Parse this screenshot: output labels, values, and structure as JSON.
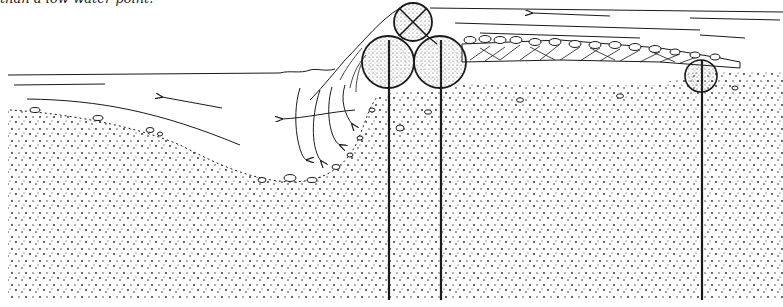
{
  "caption": "than a low-water point.",
  "diagram": {
    "type": "cross-section",
    "colors": {
      "ink": "#1a1a1a",
      "background": "#ffffff"
    },
    "elements": {
      "streambed": "stippled sand/gravel substrate",
      "scour_hole": "depression downstream of logs with pebble lining",
      "logs": [
        {
          "name": "top-log",
          "marked": "X (crossed)",
          "cx": 413,
          "cy": 22,
          "r": 19
        },
        {
          "name": "left-base-log",
          "cx": 388,
          "cy": 62,
          "r": 26
        },
        {
          "name": "right-base-log",
          "cx": 440,
          "cy": 62,
          "r": 26
        },
        {
          "name": "right-small-log",
          "cx": 701,
          "cy": 76,
          "r": 16
        }
      ],
      "stakes": [
        {
          "name": "stake-1",
          "x": 389
        },
        {
          "name": "stake-2",
          "x": 441
        },
        {
          "name": "stake-3",
          "x": 702
        }
      ],
      "flow_arrows": [
        "upper-right flow arrow pointing left",
        "lower-left flow arrow pointing left",
        "eddy arrows into scour hole"
      ],
      "fill_layer": "brush/debris layer with cobbles behind logs"
    }
  }
}
